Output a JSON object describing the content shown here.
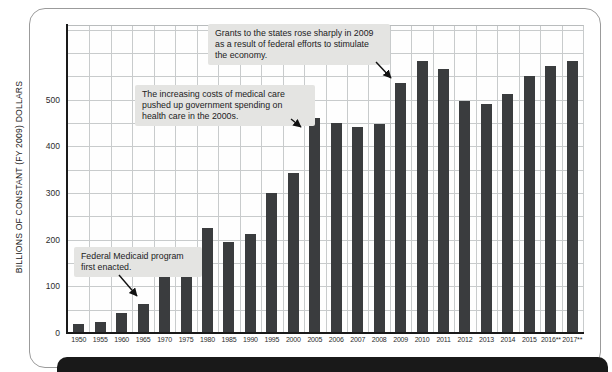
{
  "chart_data": {
    "type": "bar",
    "title": "",
    "xlabel": "",
    "ylabel": "BILLIONS OF CONSTANT (FY 2009) DOLLARS",
    "categories": [
      "1950",
      "1955",
      "1960",
      "1965",
      "1970",
      "1975",
      "1980",
      "1985",
      "1990",
      "1995",
      "2000",
      "2005",
      "2006",
      "2007",
      "2008",
      "2009",
      "2010",
      "2011",
      "2012",
      "2013",
      "2014",
      "2015",
      "2016**",
      "2017**"
    ],
    "values": [
      21,
      25,
      44,
      65,
      124,
      175,
      228,
      197,
      214,
      302,
      344,
      462,
      452,
      444,
      450,
      538,
      586,
      567,
      500,
      493,
      515,
      552,
      574,
      584
    ],
    "ylim": [
      0,
      660
    ],
    "ytick_interval": 100,
    "grid_interval": 50,
    "grid": true,
    "legend": "none",
    "bar_color": "#3a3c3e",
    "annotations": [
      {
        "text": "Grants to the states rose sharply in 2009 as a result of federal efforts to stimulate the economy.",
        "target_category": "2009"
      },
      {
        "text": "The increasing costs of medical care pushed up government spending on health care in the 2000s.",
        "target_category": "2005"
      },
      {
        "text": "Federal Medicaid program first enacted.",
        "target_category": "1965"
      }
    ]
  },
  "colors": {
    "bar": "#3a3c3e",
    "gridline": "#c8cbcc",
    "axis": "#1a1a1a",
    "annotation_background": "#e4e4e2",
    "frame_border": "#9b9b9b",
    "footer_bar": "#191919",
    "background": "#ffffff"
  }
}
